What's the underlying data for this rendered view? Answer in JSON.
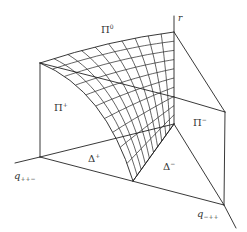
{
  "figure": {
    "stroke_color": "#222222",
    "background": "#ffffff"
  },
  "labels": {
    "pi0": {
      "base": "Π",
      "sup": "0"
    },
    "pi_plus": {
      "base": "Π",
      "sup": "+"
    },
    "pi_minus": {
      "base": "Π",
      "sup": "−"
    },
    "delta_plus": {
      "base": "Δ",
      "sup": "+"
    },
    "delta_minus": {
      "base": "Δ",
      "sup": "−"
    },
    "axis_r": {
      "base": "r"
    },
    "axis_q_ppm": {
      "base": "q",
      "sub": "++−"
    },
    "axis_q_mpp": {
      "base": "q",
      "sub": "−++"
    }
  }
}
